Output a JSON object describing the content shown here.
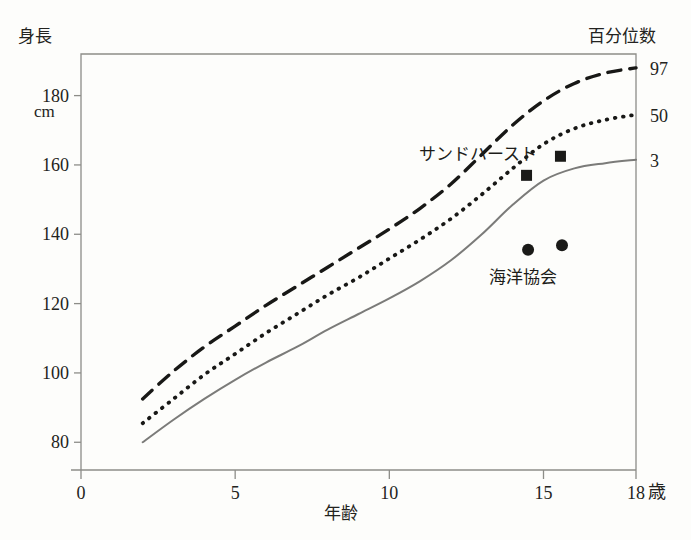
{
  "chart_data": {
    "type": "line",
    "title": "",
    "xlabel": "年齢",
    "ylabel": "身長",
    "y_unit": "cm",
    "x_unit": "歳",
    "right_axis_title": "百分位数",
    "xlim": [
      0,
      18
    ],
    "ylim": [
      72,
      192
    ],
    "xticks": [
      0,
      5,
      10,
      15,
      18
    ],
    "xtick_labels": [
      "0",
      "5",
      "10",
      "15",
      "18"
    ],
    "yticks": [
      80,
      100,
      120,
      140,
      160,
      180
    ],
    "ytick_labels": [
      "80",
      "100",
      "120",
      "140",
      "160",
      "180"
    ],
    "grid": false,
    "legend_position": "inline-annotation",
    "right_tick_labels": [
      "97",
      "50",
      "3"
    ],
    "series": [
      {
        "name": "97",
        "percentile": 97,
        "style": "dashed",
        "color": "#181816",
        "x": [
          2,
          3,
          4,
          5,
          6,
          7,
          8,
          9,
          10,
          11,
          12,
          13,
          14,
          15,
          16,
          17,
          18
        ],
        "values": [
          92.5,
          100.5,
          107.5,
          113.5,
          119.5,
          125.0,
          130.5,
          136.0,
          141.5,
          147.5,
          154.5,
          163.0,
          171.5,
          178.5,
          183.5,
          186.5,
          188.0
        ]
      },
      {
        "name": "50",
        "percentile": 50,
        "style": "dotted",
        "color": "#181816",
        "x": [
          2,
          3,
          4,
          5,
          6,
          7,
          8,
          9,
          10,
          11,
          12,
          13,
          14,
          15,
          16,
          17,
          18
        ],
        "values": [
          85.5,
          92.5,
          99.5,
          105.5,
          111.5,
          117.0,
          122.5,
          127.5,
          133.0,
          138.5,
          144.5,
          151.5,
          159.0,
          166.0,
          170.5,
          173.0,
          174.5
        ]
      },
      {
        "name": "3",
        "percentile": 3,
        "style": "solid",
        "color": "#7b7b79",
        "x": [
          2,
          3,
          4,
          5,
          6,
          7,
          8,
          9,
          10,
          11,
          12,
          13,
          14,
          15,
          16,
          17,
          18
        ],
        "values": [
          80.0,
          86.5,
          92.5,
          98.0,
          103.0,
          107.5,
          112.5,
          117.0,
          121.5,
          126.5,
          132.5,
          140.0,
          148.5,
          155.5,
          159.0,
          160.5,
          161.5
        ]
      }
    ],
    "point_groups": [
      {
        "name": "サンドハースト",
        "marker": "square",
        "color": "#1a1a18",
        "label_x": 12.2,
        "label_y": 160.5,
        "points": [
          {
            "x": 14.45,
            "y": 157.0
          },
          {
            "x": 15.55,
            "y": 162.5
          }
        ]
      },
      {
        "name": "海洋協会",
        "marker": "circle",
        "color": "#1a1a18",
        "label_x": 15.0,
        "label_y": 124.5,
        "points": [
          {
            "x": 14.5,
            "y": 135.5
          },
          {
            "x": 15.6,
            "y": 136.8
          }
        ]
      }
    ],
    "colors": {
      "axis": "#8d8d88",
      "text": "#232320",
      "line_dark": "#181816",
      "line_gray": "#7b7b79",
      "background": "#fdfdfb"
    }
  }
}
